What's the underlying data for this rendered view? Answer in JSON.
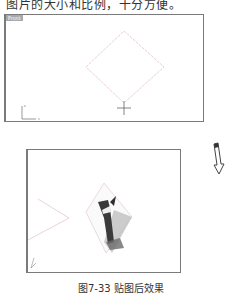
{
  "document": {
    "top_text": "图片的大小和比例，十分方便。",
    "caption": "图7-33  贴图后效果"
  },
  "viewports": {
    "front": {
      "label": "Front",
      "axis_y": "z",
      "axis_x": "x"
    },
    "perspective": {
      "label": "Perspective"
    }
  },
  "colors": {
    "border": "#7a7a7a",
    "label_bg": "#a9a9a9",
    "curve": "#e3b8bf"
  }
}
